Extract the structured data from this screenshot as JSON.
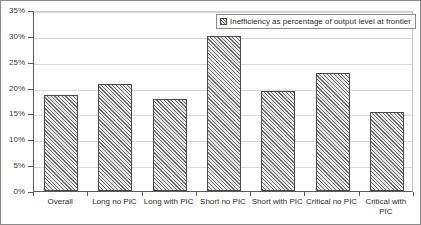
{
  "chart_data": {
    "type": "bar",
    "title": "",
    "xlabel": "",
    "ylabel": "",
    "ylim": [
      0,
      35
    ],
    "y_tick_step": 5,
    "grid": true,
    "legend_position": "top-right",
    "legend": [
      "Inefficiency as percentage of output level at frontier"
    ],
    "categories": [
      "Overall",
      "Long no PIC",
      "Long with PIC",
      "Short no PIC",
      "Short with PIC",
      "Critical no PIC",
      "Critical with PIC"
    ],
    "values": [
      18.5,
      20.7,
      17.8,
      30.0,
      19.3,
      22.8,
      15.2
    ],
    "y_tick_labels": [
      "0%",
      "5%",
      "10%",
      "15%",
      "20%",
      "25%",
      "30%",
      "35%"
    ],
    "y_tick_values": [
      0,
      5,
      10,
      15,
      20,
      25,
      30,
      35
    ],
    "series": [
      {
        "name": "Inefficiency as percentage of output level at frontier",
        "values": [
          18.5,
          20.7,
          17.8,
          30.0,
          19.3,
          22.8,
          15.2
        ]
      }
    ]
  },
  "legend": {
    "swatch_name": "hatched-pattern-swatch",
    "label": "Inefficiency as percentage of output level at frontier"
  },
  "colors": {
    "bar_fill": "#e8e8e8",
    "bar_hatch": "#6f6f6f",
    "bar_border": "#4a4a4a",
    "axis": "#5a5a5a",
    "gridline": "#d9d9d9",
    "frame": "#8a8a8a",
    "text": "#2f2f2f",
    "background": "#ffffff"
  }
}
